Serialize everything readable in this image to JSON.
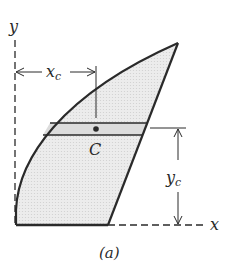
{
  "figure": {
    "caption": "(a)",
    "axes": {
      "x_label": "x",
      "y_label": "y"
    },
    "centroid": {
      "label": "C"
    },
    "dimensions": {
      "xc": {
        "main": "x",
        "sub": "c"
      },
      "yc": {
        "main": "y",
        "sub": "c"
      }
    },
    "colors": {
      "stroke": "#2a2a2a",
      "fill": "#e6e6e6",
      "strip": "#d8d8d8"
    }
  }
}
